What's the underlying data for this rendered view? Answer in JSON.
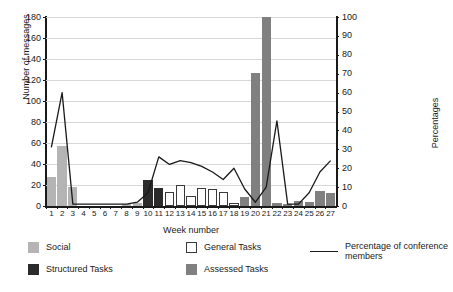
{
  "chart_data": {
    "type": "bar",
    "title": "",
    "xlabel": "Week number",
    "ylabel": "Number of messages",
    "ylabel_right": "Percentages",
    "grid": true,
    "legend_position": "bottom",
    "categories": [
      1,
      2,
      3,
      4,
      5,
      6,
      7,
      8,
      9,
      10,
      11,
      12,
      13,
      14,
      15,
      16,
      17,
      18,
      19,
      20,
      21,
      22,
      23,
      24,
      25,
      26,
      27
    ],
    "ylim": [
      0,
      180
    ],
    "yticks": [
      0,
      20,
      40,
      60,
      80,
      100,
      120,
      140,
      160,
      180
    ],
    "ylim_right": [
      0,
      100
    ],
    "yticks_right": [
      0,
      10,
      20,
      30,
      40,
      50,
      60,
      70,
      80,
      90,
      100
    ],
    "series": [
      {
        "name": "Social",
        "color": "#b4b4b4",
        "type": "bar",
        "values": [
          28,
          57,
          18,
          0,
          0,
          0,
          0,
          1,
          3,
          2,
          2,
          1,
          1,
          0,
          0,
          0,
          0,
          0,
          0,
          0,
          0,
          0,
          0,
          0,
          0,
          0,
          0
        ]
      },
      {
        "name": "Structured Tasks",
        "color": "#2b2b2b",
        "type": "bar",
        "values": [
          0,
          0,
          0,
          0,
          0,
          0,
          0,
          0,
          0,
          25,
          17,
          0,
          4,
          0,
          0,
          0,
          0,
          0,
          0,
          0,
          0,
          0,
          0,
          0,
          0,
          0,
          0
        ]
      },
      {
        "name": "General Tasks",
        "color": "#ffffff",
        "type": "bar",
        "values": [
          0,
          0,
          0,
          0,
          0,
          0,
          0,
          0,
          0,
          0,
          0,
          13,
          20,
          10,
          17,
          16,
          13,
          3,
          0,
          0,
          0,
          0,
          0,
          0,
          0,
          0,
          0
        ]
      },
      {
        "name": "Assessed Tasks",
        "color": "#808080",
        "type": "bar",
        "values": [
          0,
          0,
          0,
          0,
          0,
          0,
          0,
          0,
          0,
          0,
          0,
          0,
          0,
          0,
          0,
          0,
          0,
          0,
          9,
          127,
          180,
          3,
          1,
          5,
          4,
          14,
          12
        ]
      },
      {
        "name": "Percentage of conference members",
        "color": "#1a1a1a",
        "type": "line",
        "axis": "right",
        "values": [
          31,
          60,
          1,
          1,
          1,
          1,
          1,
          1,
          2,
          7,
          26,
          22,
          24,
          23,
          21,
          18,
          14,
          20,
          9,
          2,
          10,
          45,
          1,
          1,
          7,
          18,
          24
        ]
      }
    ]
  },
  "legend": {
    "items": [
      {
        "label": "Social",
        "color": "#b4b4b4",
        "marker": "swatch"
      },
      {
        "label": "Structured Tasks",
        "color": "#2b2b2b",
        "marker": "swatch"
      },
      {
        "label": "General Tasks",
        "color": "#ffffff",
        "marker": "swatch"
      },
      {
        "label": "Assessed Tasks",
        "color": "#808080",
        "marker": "swatch"
      },
      {
        "label": "Percentage of conference members",
        "color": "#1a1a1a",
        "marker": "line"
      }
    ]
  }
}
